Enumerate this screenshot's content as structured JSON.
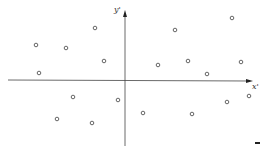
{
  "chart_data": {
    "type": "scatter",
    "title": "",
    "xlabel": "x'",
    "ylabel": "y'",
    "grid": false,
    "legend": null,
    "axes": {
      "origin_px": [
        125,
        80
      ],
      "x_range_px": [
        8,
        253
      ],
      "y_range_px": [
        10,
        146
      ]
    },
    "points_px": [
      [
        36,
        45
      ],
      [
        66,
        48
      ],
      [
        95,
        28
      ],
      [
        104,
        61
      ],
      [
        39,
        73
      ],
      [
        175,
        30
      ],
      [
        232,
        18
      ],
      [
        158,
        65
      ],
      [
        188,
        61
      ],
      [
        207,
        74
      ],
      [
        241,
        62
      ],
      [
        73,
        97
      ],
      [
        118,
        100
      ],
      [
        57,
        119
      ],
      [
        92,
        123
      ],
      [
        143,
        113
      ],
      [
        192,
        114
      ],
      [
        227,
        102
      ],
      [
        249,
        96
      ]
    ],
    "points": [
      {
        "x": -89,
        "y": 35
      },
      {
        "x": -59,
        "y": 32
      },
      {
        "x": -30,
        "y": 52
      },
      {
        "x": -21,
        "y": 19
      },
      {
        "x": -86,
        "y": 7
      },
      {
        "x": 50,
        "y": 50
      },
      {
        "x": 107,
        "y": 62
      },
      {
        "x": 33,
        "y": 15
      },
      {
        "x": 63,
        "y": 19
      },
      {
        "x": 82,
        "y": 6
      },
      {
        "x": 116,
        "y": 18
      },
      {
        "x": -52,
        "y": -17
      },
      {
        "x": -7,
        "y": -20
      },
      {
        "x": -68,
        "y": -39
      },
      {
        "x": -33,
        "y": -43
      },
      {
        "x": 18,
        "y": -33
      },
      {
        "x": 67,
        "y": -34
      },
      {
        "x": 102,
        "y": -22
      },
      {
        "x": 124,
        "y": -16
      }
    ],
    "marker": "open-circle",
    "colors": {
      "axis": "#333333",
      "marker": "#555555"
    }
  },
  "labels": {
    "x": "x'",
    "y": "y'"
  }
}
